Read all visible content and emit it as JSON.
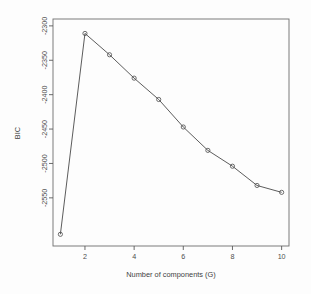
{
  "chart_data": {
    "type": "line",
    "title": "",
    "xlabel": "Number of components (G)",
    "ylabel": "BIC",
    "x": [
      1,
      2,
      3,
      4,
      5,
      6,
      7,
      8,
      9,
      10
    ],
    "values": [
      -2603,
      -2311,
      -2342,
      -2376,
      -2407,
      -2447,
      -2481,
      -2504,
      -2532,
      -2542
    ],
    "series": [
      {
        "name": "BIC",
        "values": [
          -2603,
          -2311,
          -2342,
          -2376,
          -2407,
          -2447,
          -2481,
          -2504,
          -2532,
          -2542
        ]
      }
    ],
    "xlim": [
      0.7,
      10.3
    ],
    "ylim": [
      -2620,
      -2290
    ],
    "xticks": [
      2,
      4,
      6,
      8,
      10
    ],
    "xtick_labels": [
      "2",
      "4",
      "6",
      "8",
      "10"
    ],
    "yticks": [
      -2300,
      -2350,
      -2400,
      -2450,
      -2500,
      -2550
    ],
    "ytick_labels": [
      "-2300",
      "-2350",
      "-2400",
      "-2450",
      "-2500",
      "-2550"
    ],
    "grid": false,
    "legend": "none",
    "marker": "circle",
    "line_color": "#4a4a4a",
    "marker_color": "#4a4a4a",
    "background_color": "#fdfdfd",
    "axis_color": "#5a5a5a"
  }
}
